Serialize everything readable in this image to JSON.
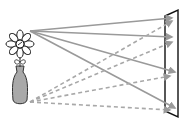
{
  "diagram": {
    "title": "Light rays from an object (flower in vase) striking a screen",
    "object": {
      "label": "flower-in-vase",
      "flower_color": "#ffffff",
      "vase_color": "#a9a9a9",
      "outline_color": "#222222"
    },
    "screen": {
      "label": "screen",
      "color": "#ffffff",
      "outline_color": "#111111"
    },
    "ray_groups": [
      {
        "name": "rays-from-flower-top",
        "style": "solid",
        "color": "#9a9a9a",
        "count": 4
      },
      {
        "name": "rays-from-vase-bottom",
        "style": "dashed",
        "color": "#a8a8a8",
        "count": 4
      }
    ]
  }
}
